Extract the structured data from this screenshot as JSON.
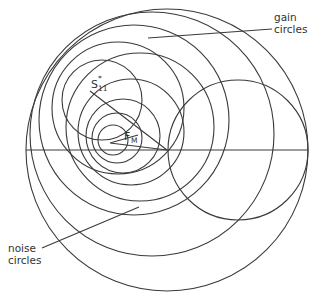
{
  "labels": {
    "gain_line1": "gain",
    "gain_line2": "circles",
    "noise_line1": "noise",
    "noise_line2": "circles",
    "s11_main": "S",
    "s11_sub": "11",
    "s11_sup": "*",
    "fm_main": "F",
    "fm_sub": "M"
  },
  "colors": {
    "stroke": "#3a3a3a",
    "background": "#ffffff"
  },
  "geometry": {
    "outer_circle": {
      "cx": 167,
      "cy": 150,
      "r": 141
    },
    "unit_resistance_circle": {
      "cx": 238,
      "cy": 150,
      "r": 70
    },
    "real_axis_y": 150,
    "s11_conj_point": [
      90,
      90
    ],
    "fm_point": [
      108,
      143
    ],
    "gain_circles": [
      {
        "cx": 102,
        "cy": 100,
        "r": 40
      },
      {
        "cx": 118,
        "cy": 110,
        "r": 66
      },
      {
        "cx": 134,
        "cy": 122,
        "r": 96
      },
      {
        "cx": 150,
        "cy": 136,
        "r": 122
      }
    ],
    "noise_circles": [
      {
        "cx": 112,
        "cy": 140,
        "r": 15
      },
      {
        "cx": 116,
        "cy": 138,
        "r": 25
      },
      {
        "cx": 122,
        "cy": 136,
        "r": 37
      },
      {
        "cx": 130,
        "cy": 133,
        "r": 52
      },
      {
        "cx": 142,
        "cy": 128,
        "r": 76
      }
    ]
  }
}
